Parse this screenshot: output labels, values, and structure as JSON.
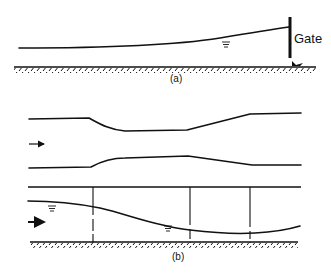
{
  "figure": {
    "part_a": {
      "label": "(a)",
      "gate_label": "Gate",
      "water_surface_symbol": "water-surface-triangle"
    },
    "part_b": {
      "label": "(b)",
      "flow_arrow_top": "flow-direction-arrow",
      "flow_arrow_bottom": "flow-direction-arrow",
      "water_surface_symbols": [
        "water-surface-triangle",
        "water-surface-triangle"
      ]
    },
    "colors": {
      "stroke": "#111111",
      "background": "#ffffff"
    }
  }
}
